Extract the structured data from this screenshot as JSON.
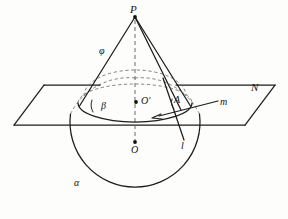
{
  "figure": {
    "background_color": "#fdfdfb",
    "stroke_color": "#1c1c1c",
    "dashed_color": "#6d6d6d"
  },
  "labels": {
    "apex": "P",
    "slant_angle": "φ",
    "plane": "N",
    "base_angle": "β",
    "base_center": "O′",
    "tangent_point": "A",
    "line_m": "m",
    "line_l": "l",
    "sphere_center": "O",
    "sphere": "α"
  },
  "geometry": {
    "apex_point": {
      "x": 135,
      "y": 16
    },
    "base_center_point": {
      "x": 135,
      "y": 103
    },
    "sphere_center_point": {
      "x": 135,
      "y": 143
    },
    "sphere_radius": 65,
    "base_ellipse": {
      "cx": 135,
      "cy": 103,
      "rx": 57,
      "ry": 19
    },
    "plane_quad": [
      {
        "x": 44,
        "y": 85
      },
      {
        "x": 275,
        "y": 85
      },
      {
        "x": 245,
        "y": 125
      },
      {
        "x": 14,
        "y": 125
      }
    ],
    "tangent_point_A": {
      "x": 178,
      "y": 105
    },
    "line_m_from": {
      "x": 159,
      "y": 116
    },
    "line_m_to": {
      "x": 218,
      "y": 101
    },
    "line_l_from": {
      "x": 163,
      "y": 80
    },
    "line_l_to": {
      "x": 184,
      "y": 140
    }
  }
}
